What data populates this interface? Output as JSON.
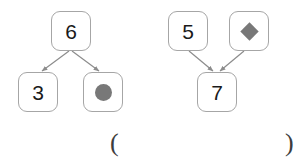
{
  "diagram": {
    "background_color": "#ffffff",
    "box_border_color": "#a6a6a6",
    "arrow_color": "#8c8c8c",
    "shape_fill_color": "#787878",
    "text_color": "#1a1a1a",
    "groups": [
      {
        "name": "left-group",
        "direction": "top-to-bottom",
        "nodes": [
          {
            "id": "left-top",
            "label": "6",
            "kind": "number"
          },
          {
            "id": "left-bottom-left",
            "label": "3",
            "kind": "number"
          },
          {
            "id": "left-bottom-right",
            "label": "",
            "kind": "shape",
            "shape": "circle-icon"
          }
        ],
        "edges": [
          {
            "from": "left-top",
            "to": "left-bottom-left",
            "arrowhead": "to"
          },
          {
            "from": "left-top",
            "to": "left-bottom-right",
            "arrowhead": "to"
          }
        ]
      },
      {
        "name": "right-group",
        "direction": "bottom-up-converge",
        "nodes": [
          {
            "id": "right-top-left",
            "label": "5",
            "kind": "number"
          },
          {
            "id": "right-top-right",
            "label": "",
            "kind": "shape",
            "shape": "diamond-icon"
          },
          {
            "id": "right-bottom",
            "label": "7",
            "kind": "number"
          }
        ],
        "edges": [
          {
            "from": "right-top-left",
            "to": "right-bottom",
            "arrowhead": "to"
          },
          {
            "from": "right-top-right",
            "to": "right-bottom",
            "arrowhead": "to"
          }
        ]
      }
    ]
  },
  "answer_blank": {
    "open_paren": "(",
    "close_paren": ")",
    "value": ""
  }
}
